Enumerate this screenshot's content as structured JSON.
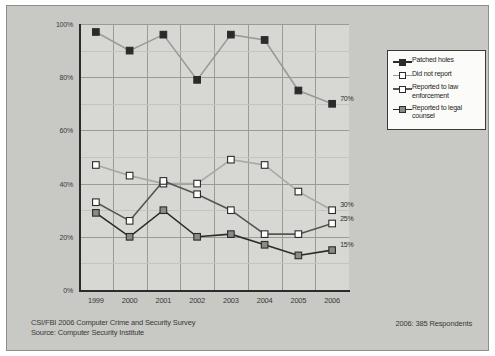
{
  "chart_data": {
    "type": "line",
    "title": "",
    "xlabel": "",
    "ylabel": "",
    "categories": [
      "1999",
      "2000",
      "2001",
      "2002",
      "2003",
      "2004",
      "2005",
      "2006"
    ],
    "ylim": [
      0,
      100
    ],
    "yticks": [
      "0%",
      "20%",
      "40%",
      "60%",
      "80%",
      "100%"
    ],
    "ytick_values": [
      0,
      20,
      40,
      60,
      80,
      100
    ],
    "grid": true,
    "legend_position": "right",
    "series": [
      {
        "name": "Patched holes",
        "marker": "filled-square",
        "color": "#2b2b2b",
        "line_color": "#9a9a96",
        "values": [
          97,
          90,
          96,
          79,
          96,
          94,
          75,
          70
        ],
        "end_label": "70%"
      },
      {
        "name": "Did not report",
        "marker": "open-square",
        "color": "#ffffff",
        "line_color": "#a8a8a4",
        "values": [
          47,
          43,
          40,
          40,
          49,
          47,
          37,
          30
        ],
        "end_label": "30%"
      },
      {
        "name": "Reported to law enforcement",
        "marker": "open-square",
        "color": "#ffffff",
        "line_color": "#555553",
        "values": [
          33,
          26,
          41,
          36,
          30,
          21,
          21,
          25
        ],
        "end_label": "25%"
      },
      {
        "name": "Reported to legal counsel",
        "marker": "shaded-square",
        "color": "#8a8a86",
        "line_color": "#2b2b2b",
        "values": [
          29,
          20,
          30,
          20,
          21,
          17,
          13,
          15
        ],
        "end_label": "15%"
      }
    ]
  },
  "legend": {
    "items": [
      {
        "label": "Patched holes"
      },
      {
        "label": "Did not report"
      },
      {
        "label": "Reported to law enforcement"
      },
      {
        "label": "Reported to legal counsel"
      }
    ]
  },
  "footer": {
    "line1": "CSI/FBI 2006 Computer Crime and Security Survey",
    "line2": "Source: Computer Security Institute",
    "respondents": "2006: 385 Respondents"
  }
}
